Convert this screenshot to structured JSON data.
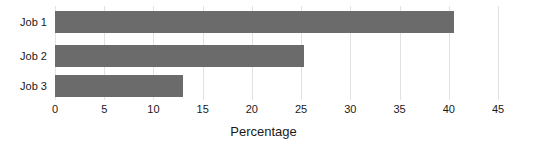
{
  "chart_data": {
    "type": "bar",
    "orientation": "horizontal",
    "title": "",
    "subtitle": "",
    "xlabel": "Percentage",
    "ylabel": "",
    "categories": [
      "Job 1",
      "Job 2",
      "Job 3"
    ],
    "values": [
      40.5,
      25.3,
      13.0
    ],
    "xlim": [
      0,
      45
    ],
    "xticks": [
      0,
      5,
      10,
      15,
      20,
      25,
      30,
      35,
      40,
      45
    ],
    "xtick_labels": [
      "0",
      "5",
      "10",
      "15",
      "20",
      "25",
      "30",
      "35",
      "40",
      "45"
    ],
    "grid": true,
    "grid_axis": "x",
    "legend": false,
    "legend_position": "none",
    "bar_color": "#6b6b6b",
    "grid_color": "#e2e2e2",
    "background_color": "#ffffff",
    "text_color": "#1a1a1a"
  }
}
